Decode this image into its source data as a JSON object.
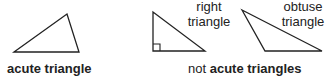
{
  "figure": {
    "acute": {
      "label": "acute triangle",
      "points": "14,52 67,14 79,52"
    },
    "right": {
      "label_line1": "right",
      "label_line2": "triangle",
      "points": "153,12 153,51 205,51"
    },
    "obtuse": {
      "label_line1": "obtuse",
      "label_line2": "triangle",
      "points": "242,10 265,51 322,51"
    },
    "caption_prefix": "not",
    "caption_bold": "acute triangles",
    "stroke_color": "#222222"
  }
}
